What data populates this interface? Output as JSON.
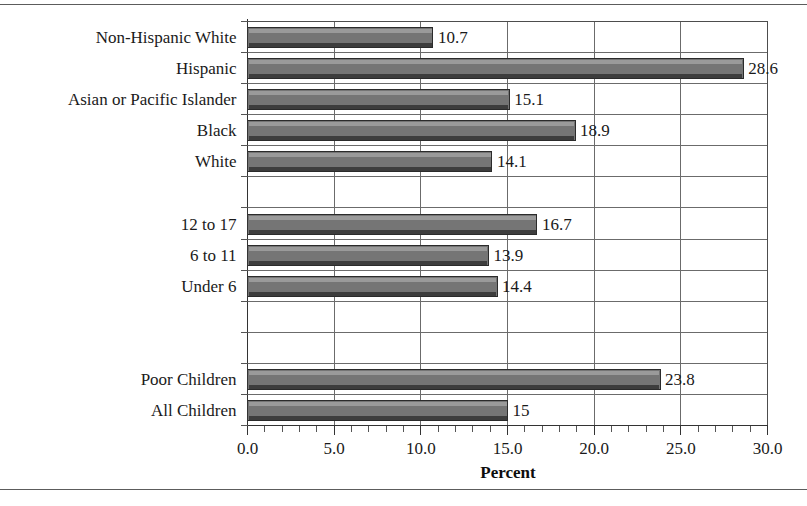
{
  "chart_data": {
    "type": "bar",
    "orientation": "horizontal",
    "title": "",
    "xlabel": "Percent",
    "ylabel": "",
    "xlim": [
      0.0,
      30.0
    ],
    "xticks": [
      "0.0",
      "5.0",
      "10.0",
      "15.0",
      "20.0",
      "25.0",
      "30.0"
    ],
    "xtick_values": [
      0,
      5,
      10,
      15,
      20,
      25,
      30
    ],
    "minor_tick_step": 1,
    "grid": true,
    "legend": null,
    "categories": [
      "Non-Hispanic White",
      "Hispanic",
      "Asian or Pacific Islander",
      "Black",
      "White",
      "",
      "12 to 17",
      "6 to 11",
      "Under 6",
      "",
      "",
      "Poor Children",
      "All Children"
    ],
    "values": [
      10.7,
      28.6,
      15.1,
      18.9,
      14.1,
      null,
      16.7,
      13.9,
      14.4,
      null,
      null,
      23.8,
      15
    ],
    "value_labels": [
      "10.7",
      "28.6",
      "15.1",
      "18.9",
      "14.1",
      "",
      "16.7",
      "13.9",
      "14.4",
      "",
      "",
      "23.8",
      "15"
    ],
    "bar_color": "#757575",
    "bar_edge_color": "#2b2b2b",
    "bar_highlight_color": "#9a9a9a",
    "plot_background": "#ffffff"
  },
  "axis": {
    "x_title": "Percent"
  }
}
